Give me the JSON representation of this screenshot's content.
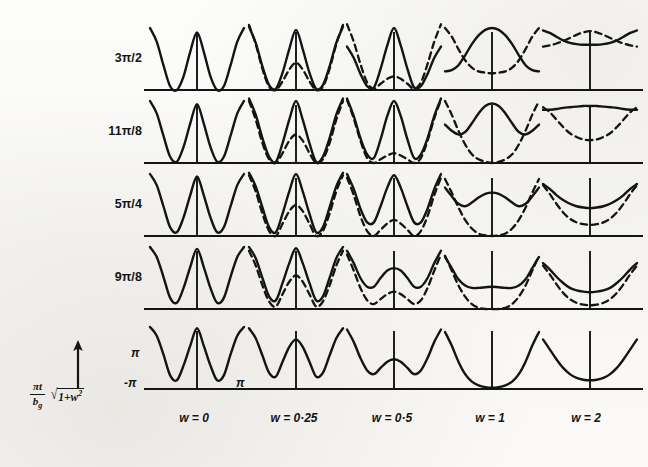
{
  "figure": {
    "kind": "scientific-figure-grid",
    "background_color": "#faf9f6",
    "ink_color": "#141414",
    "row_axis_caption": {
      "fraction_numerator": "πt",
      "fraction_denominator": "b",
      "fraction_denominator_subscript": "g",
      "radical_label": "√",
      "radicand_text": "1+w",
      "radicand_exponent": "2",
      "arrow": "↑"
    },
    "row_labels": [
      "3π/2",
      "11π/8",
      "5π/4",
      "9π/8",
      "π"
    ],
    "column_labels": [
      "w = 0",
      "w = 0·25",
      "w = 0·5",
      "w = 1",
      "w = 2"
    ],
    "axis_tick_labels": {
      "y_top": "π",
      "y_bottom": "-π",
      "x_right": "π"
    }
  },
  "chart_data": {
    "type": "line",
    "title": "",
    "subtitle": "",
    "xlabel": "w",
    "ylabel": "(πt/b_g)√(1+w²)",
    "grid": false,
    "legend": {
      "position": "none",
      "entries": [
        {
          "name": "solid branch",
          "style": "solid"
        },
        {
          "name": "dashed branch",
          "style": "dashed"
        }
      ]
    },
    "panel_axis": {
      "x_range": [
        -3.14159,
        3.14159
      ],
      "x_ticks": [
        "-π",
        "π"
      ],
      "y_range": [
        0,
        1
      ],
      "y_ticks": [
        "-π",
        "π"
      ]
    },
    "rows": [
      "3π/2",
      "11π/8",
      "5π/4",
      "9π/8",
      "π"
    ],
    "columns": [
      0,
      0.25,
      0.5,
      1,
      2
    ],
    "panels": [
      {
        "row": "3π/2",
        "w": 0,
        "solid": [
          1.0,
          0.78,
          0.4,
          0.06,
          0.0,
          0.22,
          0.62,
          0.93,
          0.62,
          0.22,
          0.0,
          0.06,
          0.4,
          0.78,
          1.0
        ],
        "dashed": null
      },
      {
        "row": "3π/2",
        "w": 0.25,
        "solid": [
          1.02,
          0.76,
          0.38,
          0.08,
          0.02,
          0.28,
          0.66,
          0.97,
          0.66,
          0.28,
          0.02,
          0.08,
          0.38,
          0.76,
          1.02
        ],
        "dashed": [
          1.05,
          0.74,
          0.34,
          0.05,
          0.0,
          0.14,
          0.33,
          0.44,
          0.33,
          0.14,
          0.0,
          0.05,
          0.34,
          0.74,
          1.05
        ]
      },
      {
        "row": "3π/2",
        "w": 0.5,
        "solid": [
          0.7,
          0.52,
          0.26,
          0.06,
          0.04,
          0.34,
          0.72,
          1.0,
          0.72,
          0.34,
          0.04,
          0.06,
          0.26,
          0.52,
          0.7
        ],
        "dashed": [
          1.06,
          0.78,
          0.42,
          0.12,
          0.02,
          0.1,
          0.18,
          0.22,
          0.18,
          0.1,
          0.02,
          0.12,
          0.42,
          0.78,
          1.06
        ]
      },
      {
        "row": "3π/2",
        "w": 1,
        "solid": [
          0.3,
          0.32,
          0.4,
          0.56,
          0.74,
          0.88,
          0.97,
          1.0,
          0.97,
          0.88,
          0.74,
          0.56,
          0.4,
          0.32,
          0.3
        ],
        "dashed": [
          1.0,
          0.86,
          0.66,
          0.48,
          0.36,
          0.3,
          0.28,
          0.27,
          0.28,
          0.3,
          0.36,
          0.48,
          0.66,
          0.86,
          1.0
        ]
      },
      {
        "row": "3π/2",
        "w": 2,
        "solid": [
          0.96,
          0.92,
          0.86,
          0.8,
          0.76,
          0.74,
          0.73,
          0.73,
          0.73,
          0.74,
          0.76,
          0.8,
          0.86,
          0.92,
          0.96
        ],
        "dashed": [
          0.7,
          0.72,
          0.75,
          0.79,
          0.84,
          0.89,
          0.93,
          0.95,
          0.93,
          0.89,
          0.84,
          0.79,
          0.75,
          0.72,
          0.7
        ]
      },
      {
        "row": "11π/8",
        "w": 0,
        "solid": [
          1.0,
          0.8,
          0.44,
          0.1,
          0.02,
          0.26,
          0.64,
          0.95,
          0.64,
          0.26,
          0.02,
          0.1,
          0.44,
          0.8,
          1.0
        ],
        "dashed": null
      },
      {
        "row": "11π/8",
        "w": 0.25,
        "solid": [
          1.04,
          0.78,
          0.4,
          0.1,
          0.02,
          0.32,
          0.7,
          1.0,
          0.7,
          0.32,
          0.02,
          0.1,
          0.4,
          0.78,
          1.04
        ],
        "dashed": [
          1.0,
          0.7,
          0.32,
          0.06,
          0.0,
          0.16,
          0.36,
          0.46,
          0.36,
          0.16,
          0.0,
          0.06,
          0.32,
          0.7,
          1.0
        ]
      },
      {
        "row": "11π/8",
        "w": 0.5,
        "solid": [
          1.04,
          0.76,
          0.4,
          0.14,
          0.08,
          0.38,
          0.76,
          1.0,
          0.76,
          0.38,
          0.08,
          0.14,
          0.4,
          0.76,
          1.04
        ],
        "dashed": [
          1.02,
          0.72,
          0.36,
          0.08,
          0.0,
          0.06,
          0.12,
          0.16,
          0.12,
          0.06,
          0.0,
          0.08,
          0.36,
          0.72,
          1.02
        ]
      },
      {
        "row": "11π/8",
        "w": 1,
        "solid": [
          0.62,
          0.52,
          0.46,
          0.5,
          0.64,
          0.8,
          0.92,
          0.96,
          0.92,
          0.8,
          0.64,
          0.5,
          0.46,
          0.52,
          0.62
        ],
        "dashed": [
          1.0,
          0.78,
          0.52,
          0.3,
          0.14,
          0.06,
          0.02,
          0.0,
          0.02,
          0.06,
          0.14,
          0.3,
          0.52,
          0.78,
          1.0
        ]
      },
      {
        "row": "11π/8",
        "w": 2,
        "solid": [
          0.86,
          0.86,
          0.87,
          0.89,
          0.9,
          0.91,
          0.92,
          0.92,
          0.92,
          0.91,
          0.9,
          0.89,
          0.87,
          0.86,
          0.86
        ],
        "dashed": [
          0.9,
          0.82,
          0.7,
          0.58,
          0.48,
          0.42,
          0.38,
          0.37,
          0.38,
          0.42,
          0.48,
          0.58,
          0.7,
          0.82,
          0.9
        ]
      },
      {
        "row": "5π/4",
        "w": 0,
        "solid": [
          1.0,
          0.82,
          0.48,
          0.14,
          0.06,
          0.3,
          0.66,
          0.96,
          0.66,
          0.3,
          0.06,
          0.14,
          0.48,
          0.82,
          1.0
        ],
        "dashed": null
      },
      {
        "row": "5π/4",
        "w": 0.25,
        "solid": [
          1.02,
          0.8,
          0.46,
          0.14,
          0.06,
          0.36,
          0.72,
          1.0,
          0.72,
          0.36,
          0.06,
          0.14,
          0.46,
          0.8,
          1.02
        ],
        "dashed": [
          0.98,
          0.72,
          0.36,
          0.08,
          0.0,
          0.2,
          0.4,
          0.5,
          0.4,
          0.2,
          0.0,
          0.08,
          0.36,
          0.72,
          0.98
        ]
      },
      {
        "row": "5π/4",
        "w": 0.5,
        "solid": [
          1.0,
          0.76,
          0.44,
          0.22,
          0.22,
          0.48,
          0.78,
          0.98,
          0.78,
          0.48,
          0.22,
          0.22,
          0.44,
          0.76,
          1.0
        ],
        "dashed": [
          0.94,
          0.66,
          0.32,
          0.08,
          0.0,
          0.1,
          0.2,
          0.26,
          0.2,
          0.1,
          0.0,
          0.08,
          0.32,
          0.66,
          0.94
        ]
      },
      {
        "row": "5π/4",
        "w": 1,
        "solid": [
          0.78,
          0.64,
          0.52,
          0.48,
          0.54,
          0.62,
          0.68,
          0.7,
          0.68,
          0.62,
          0.54,
          0.48,
          0.52,
          0.64,
          0.78
        ],
        "dashed": [
          0.92,
          0.7,
          0.46,
          0.26,
          0.12,
          0.04,
          0.01,
          0.0,
          0.01,
          0.04,
          0.12,
          0.26,
          0.46,
          0.7,
          0.92
        ]
      },
      {
        "row": "5π/4",
        "w": 2,
        "solid": [
          0.84,
          0.76,
          0.66,
          0.58,
          0.52,
          0.48,
          0.46,
          0.45,
          0.46,
          0.48,
          0.52,
          0.58,
          0.66,
          0.76,
          0.84
        ],
        "dashed": [
          0.82,
          0.68,
          0.52,
          0.38,
          0.28,
          0.22,
          0.19,
          0.18,
          0.19,
          0.22,
          0.28,
          0.38,
          0.52,
          0.68,
          0.82
        ]
      },
      {
        "row": "9π/8",
        "w": 0,
        "solid": [
          1.0,
          0.84,
          0.52,
          0.18,
          0.1,
          0.34,
          0.68,
          0.97,
          0.68,
          0.34,
          0.1,
          0.18,
          0.52,
          0.84,
          1.0
        ],
        "dashed": null
      },
      {
        "row": "9π/8",
        "w": 0.25,
        "solid": [
          1.0,
          0.82,
          0.5,
          0.2,
          0.14,
          0.42,
          0.74,
          0.98,
          0.74,
          0.42,
          0.14,
          0.2,
          0.5,
          0.82,
          1.0
        ],
        "dashed": [
          0.94,
          0.7,
          0.38,
          0.12,
          0.04,
          0.24,
          0.44,
          0.54,
          0.44,
          0.24,
          0.04,
          0.12,
          0.38,
          0.7,
          0.94
        ]
      },
      {
        "row": "9π/8",
        "w": 0.5,
        "solid": [
          0.94,
          0.74,
          0.5,
          0.36,
          0.36,
          0.5,
          0.62,
          0.66,
          0.62,
          0.5,
          0.36,
          0.36,
          0.5,
          0.74,
          0.94
        ],
        "dashed": [
          0.88,
          0.62,
          0.34,
          0.14,
          0.08,
          0.16,
          0.24,
          0.28,
          0.24,
          0.16,
          0.08,
          0.14,
          0.34,
          0.62,
          0.88
        ]
      },
      {
        "row": "9π/8",
        "w": 1,
        "solid": [
          0.84,
          0.66,
          0.48,
          0.38,
          0.34,
          0.34,
          0.35,
          0.36,
          0.35,
          0.34,
          0.34,
          0.38,
          0.48,
          0.66,
          0.84
        ],
        "dashed": [
          0.86,
          0.62,
          0.38,
          0.2,
          0.08,
          0.02,
          0.0,
          0.0,
          0.0,
          0.02,
          0.08,
          0.2,
          0.38,
          0.62,
          0.86
        ]
      },
      {
        "row": "9π/8",
        "w": 2,
        "solid": [
          0.74,
          0.64,
          0.52,
          0.42,
          0.34,
          0.3,
          0.28,
          0.27,
          0.28,
          0.3,
          0.34,
          0.42,
          0.52,
          0.64,
          0.74
        ],
        "dashed": [
          0.7,
          0.56,
          0.4,
          0.26,
          0.16,
          0.1,
          0.07,
          0.06,
          0.07,
          0.1,
          0.16,
          0.26,
          0.4,
          0.56,
          0.7
        ]
      },
      {
        "row": "π",
        "w": 0,
        "solid": [
          1.0,
          0.86,
          0.56,
          0.22,
          0.14,
          0.38,
          0.7,
          0.98,
          0.7,
          0.38,
          0.14,
          0.22,
          0.56,
          0.86,
          1.0
        ],
        "dashed": null
      },
      {
        "row": "π",
        "w": 0.25,
        "solid": [
          0.98,
          0.82,
          0.54,
          0.26,
          0.2,
          0.44,
          0.68,
          0.8,
          0.68,
          0.44,
          0.2,
          0.26,
          0.54,
          0.82,
          0.98
        ],
        "dashed": null
      },
      {
        "row": "π",
        "w": 0.5,
        "solid": [
          0.96,
          0.76,
          0.5,
          0.3,
          0.24,
          0.34,
          0.44,
          0.48,
          0.44,
          0.34,
          0.24,
          0.3,
          0.5,
          0.76,
          0.96
        ],
        "dashed": null
      },
      {
        "row": "π",
        "w": 1,
        "solid": [
          0.92,
          0.7,
          0.44,
          0.24,
          0.12,
          0.06,
          0.03,
          0.02,
          0.03,
          0.06,
          0.12,
          0.24,
          0.44,
          0.7,
          0.92
        ],
        "dashed": null
      },
      {
        "row": "π",
        "w": 2,
        "solid": [
          0.8,
          0.64,
          0.48,
          0.34,
          0.24,
          0.18,
          0.15,
          0.14,
          0.15,
          0.18,
          0.24,
          0.34,
          0.48,
          0.64,
          0.8
        ],
        "dashed": null
      }
    ]
  }
}
